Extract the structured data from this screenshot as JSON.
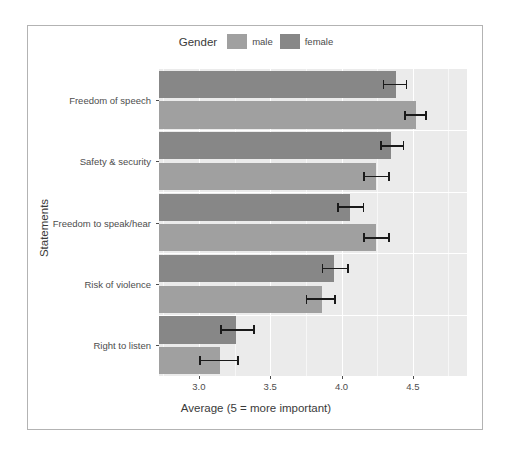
{
  "legend": {
    "title": "Gender",
    "entries": [
      {
        "label": "male",
        "color": "#a0a0a0"
      },
      {
        "label": "female",
        "color": "#878787"
      }
    ]
  },
  "axes": {
    "x_title": "Average (5 = more important)",
    "y_title": "Statements",
    "x_ticks": [
      "3.0",
      "3.5",
      "4.0",
      "4.5"
    ]
  },
  "chart_data": {
    "type": "bar",
    "orientation": "horizontal",
    "title": "",
    "xlabel": "Average (5 = more important)",
    "ylabel": "Statements",
    "xlim": [
      2.72,
      4.88
    ],
    "xticks": [
      3.0,
      3.5,
      4.0,
      4.5
    ],
    "grid": true,
    "legend_title": "Gender",
    "legend_position": "top",
    "categories": [
      "Freedom of speech",
      "Safety & security",
      "Freedom to speak/hear",
      "Risk of violence",
      "Right to listen"
    ],
    "series": [
      {
        "name": "female",
        "color": "#878787",
        "values": [
          4.38,
          4.35,
          4.06,
          3.95,
          3.26
        ],
        "error_low": [
          4.29,
          4.27,
          3.97,
          3.86,
          3.15
        ],
        "error_high": [
          4.46,
          4.44,
          4.16,
          4.05,
          3.39
        ]
      },
      {
        "name": "male",
        "color": "#a0a0a0",
        "values": [
          4.52,
          4.24,
          4.24,
          3.86,
          3.15
        ],
        "error_low": [
          4.44,
          4.15,
          4.15,
          3.75,
          3.0
        ],
        "error_high": [
          4.6,
          4.34,
          4.34,
          3.96,
          3.28
        ]
      }
    ],
    "bar_order_top_to_bottom": [
      {
        "category": "Freedom of speech",
        "group": "female",
        "value": 4.38,
        "ci": [
          4.29,
          4.46
        ]
      },
      {
        "category": "Freedom of speech",
        "group": "male",
        "value": 4.52,
        "ci": [
          4.44,
          4.6
        ]
      },
      {
        "category": "Safety & security",
        "group": "female",
        "value": 4.35,
        "ci": [
          4.27,
          4.44
        ]
      },
      {
        "category": "Safety & security",
        "group": "male",
        "value": 4.24,
        "ci": [
          4.15,
          4.34
        ]
      },
      {
        "category": "Freedom to speak/hear",
        "group": "female",
        "value": 4.06,
        "ci": [
          3.97,
          4.16
        ]
      },
      {
        "category": "Freedom to speak/hear",
        "group": "male",
        "value": 4.24,
        "ci": [
          4.15,
          4.34
        ]
      },
      {
        "category": "Risk of violence",
        "group": "female",
        "value": 3.95,
        "ci": [
          3.86,
          4.05
        ]
      },
      {
        "category": "Risk of violence",
        "group": "male",
        "value": 3.86,
        "ci": [
          3.75,
          3.96
        ]
      },
      {
        "category": "Right to listen",
        "group": "female",
        "value": 3.26,
        "ci": [
          3.15,
          3.39
        ]
      },
      {
        "category": "Right to listen",
        "group": "male",
        "value": 3.15,
        "ci": [
          3.0,
          3.28
        ]
      }
    ]
  }
}
